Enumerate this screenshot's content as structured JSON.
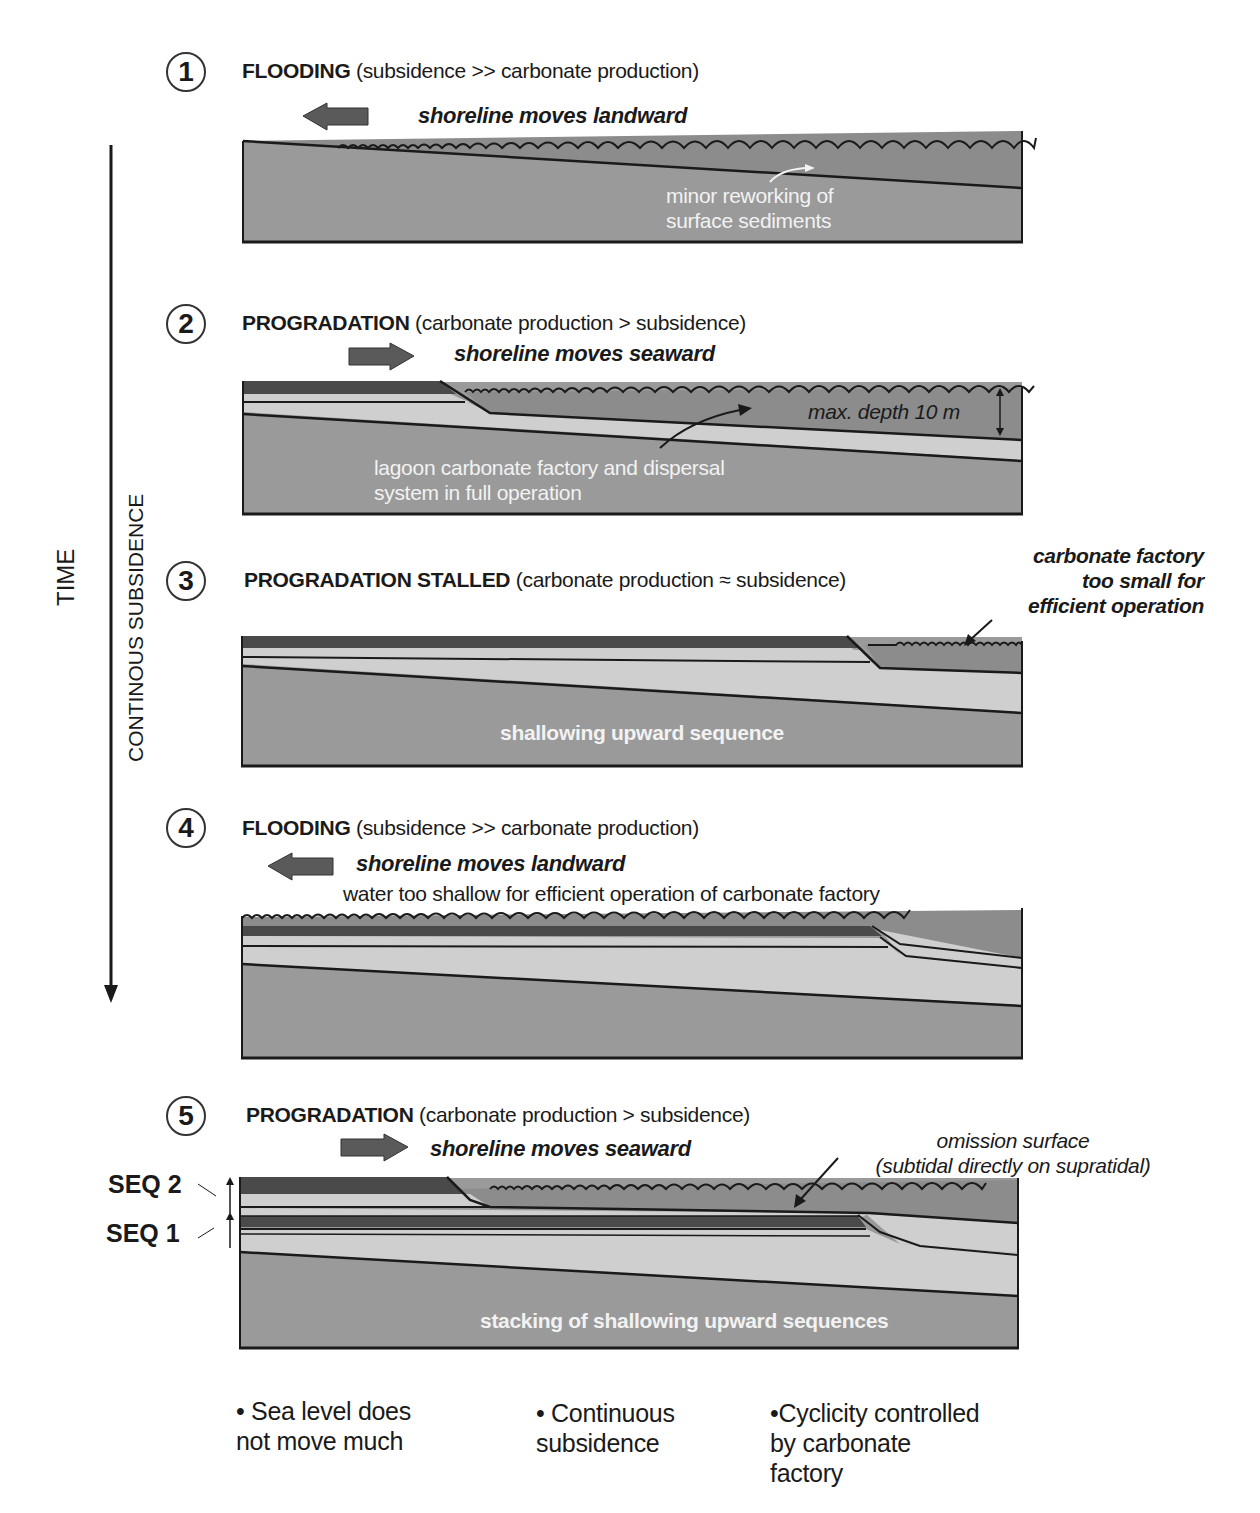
{
  "colors": {
    "background": "#ffffff",
    "sediment_base": "#9a9a9a",
    "water": "#8c8c8c",
    "light_layer": "#cfcfcf",
    "dark_layer": "#4a4a4a",
    "arrow_fill": "#5a5a5a",
    "line": "#1a1a1a"
  },
  "axis": {
    "time_label": "TIME",
    "subsidence_label": "CONTINOUS SUBSIDENCE"
  },
  "panels": [
    {
      "number": "1",
      "title_bold": "FLOODING",
      "title_rest": " (subsidence >> carbonate production)",
      "arrow_direction": "left",
      "shoreline_label": "shoreline moves landward",
      "annotations": [
        "minor reworking of",
        "surface sediments"
      ]
    },
    {
      "number": "2",
      "title_bold": "PROGRADATION",
      "title_rest": " (carbonate production > subsidence)",
      "arrow_direction": "right",
      "shoreline_label": "shoreline moves seaward",
      "depth_label": "max. depth 10 m",
      "annotations": [
        "lagoon carbonate factory and dispersal",
        "system in full operation"
      ]
    },
    {
      "number": "3",
      "title_bold": "PROGRADATION STALLED",
      "title_rest": " (carbonate production ≈ subsidence)",
      "side_note": [
        "carbonate factory",
        "too small for",
        "efficient operation"
      ],
      "inner_label": "shallowing upward sequence"
    },
    {
      "number": "4",
      "title_bold": "FLOODING",
      "title_rest": " (subsidence >> carbonate production)",
      "arrow_direction": "left",
      "shoreline_label": "shoreline moves landward",
      "note": "water too shallow for efficient operation of carbonate factory"
    },
    {
      "number": "5",
      "title_bold": "PROGRADATION",
      "title_rest": " (carbonate production > subsidence)",
      "arrow_direction": "right",
      "shoreline_label": "shoreline moves seaward",
      "omission_note": [
        "omission surface",
        "(subtidal directly on supratidal)"
      ],
      "seq_labels": [
        "SEQ 2",
        "SEQ 1"
      ],
      "inner_label": "stacking of shallowing upward sequences"
    }
  ],
  "bullets": [
    "• Sea level does\n  not move much",
    "• Continuous\n  subsidence",
    "•Cyclicity controlled\n  by carbonate\n  factory"
  ]
}
